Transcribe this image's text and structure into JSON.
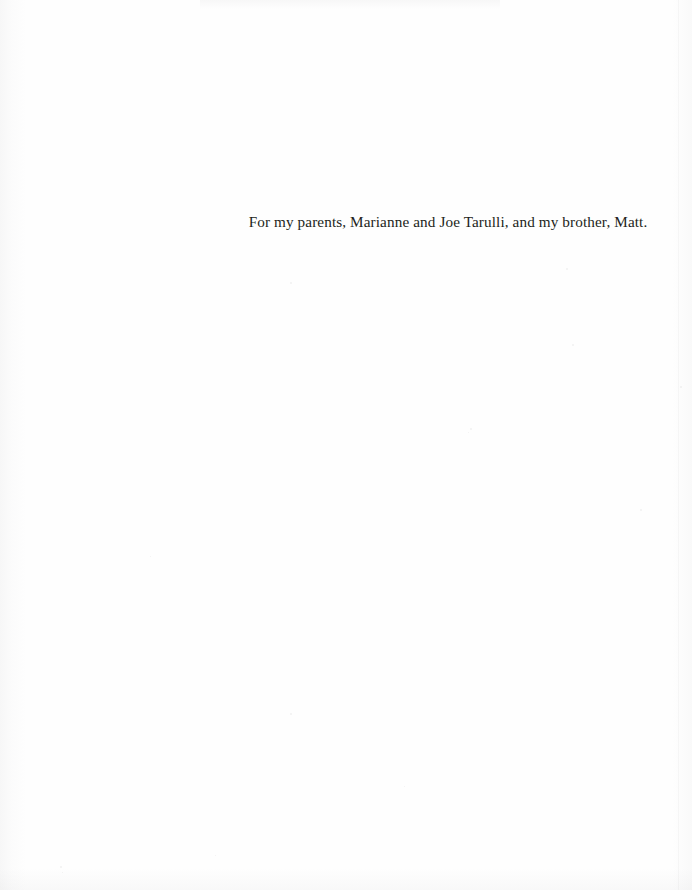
{
  "page": {
    "kind": "book-dedication-page",
    "width": 692,
    "height": 890,
    "background_color": "#fefefe",
    "text_color": "#231f20"
  },
  "dedication": {
    "text": "For my parents, Marianne and Joe Tarulli, and my brother, Matt."
  },
  "specks": [
    {
      "x": 566,
      "y": 268,
      "size": 2
    },
    {
      "x": 572,
      "y": 344,
      "size": 2
    },
    {
      "x": 680,
      "y": 386,
      "size": 2
    },
    {
      "x": 290,
      "y": 282,
      "size": 2
    },
    {
      "x": 470,
      "y": 428,
      "size": 2
    },
    {
      "x": 468,
      "y": 432,
      "size": 1
    },
    {
      "x": 640,
      "y": 509,
      "size": 2
    },
    {
      "x": 150,
      "y": 556,
      "size": 1
    },
    {
      "x": 290,
      "y": 713,
      "size": 2
    },
    {
      "x": 404,
      "y": 786,
      "size": 1
    },
    {
      "x": 60,
      "y": 866,
      "size": 2
    },
    {
      "x": 62,
      "y": 872,
      "size": 1
    },
    {
      "x": 215,
      "y": 855,
      "size": 1
    }
  ]
}
